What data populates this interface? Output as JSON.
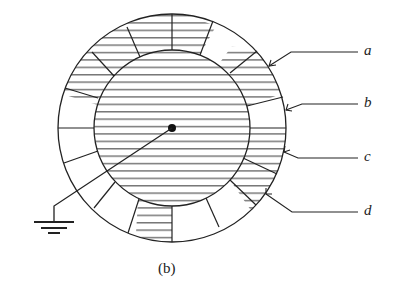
{
  "figure": {
    "caption": "(b)",
    "labels": [
      {
        "id": "a",
        "text": "a"
      },
      {
        "id": "b",
        "text": "b"
      },
      {
        "id": "c",
        "text": "c"
      },
      {
        "id": "d",
        "text": "d"
      }
    ],
    "colors": {
      "line": "#222222",
      "background": "#ffffff"
    }
  }
}
